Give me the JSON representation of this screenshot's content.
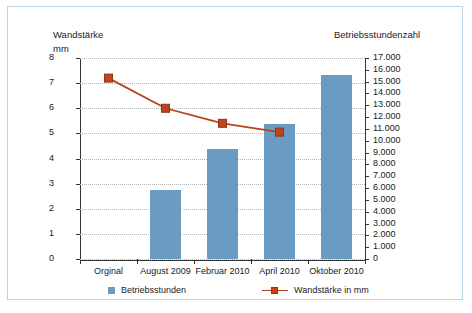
{
  "chart_data": {
    "type": "bar",
    "title": "",
    "categories": [
      "Orginal",
      "August 2009",
      "Februar 2010",
      "April 2010",
      "Oktober 2010"
    ],
    "series": [
      {
        "name": "Betriebsstunden",
        "type": "bar",
        "axis": "right",
        "color": "#6a9bc3",
        "values": [
          0,
          5800,
          9300,
          11400,
          15600
        ]
      },
      {
        "name": "Wandstärke in mm",
        "type": "line",
        "axis": "left",
        "color": "#c0451c",
        "values": [
          7.2,
          6.0,
          5.4,
          5.05,
          null
        ]
      }
    ],
    "left_axis": {
      "title": "Wandstärke",
      "unit": "mm",
      "ylim": [
        0,
        8
      ],
      "ticks": [
        "8",
        "7",
        "6",
        "5",
        "4",
        "3",
        "2",
        "1",
        "0"
      ]
    },
    "right_axis": {
      "title": "Betriebsstundenzahl",
      "ylim": [
        0,
        17000
      ],
      "ticks": [
        "17.000",
        "16.000",
        "15.000",
        "14.000",
        "13.000",
        "12.000",
        "11.000",
        "10.000",
        "9.000",
        "8.000",
        "7.000",
        "6.000",
        "5.000",
        "4.000",
        "3.000",
        "2.000",
        "1.000",
        "0"
      ]
    },
    "xlabel": "",
    "grid": true,
    "legend_position": "bottom",
    "legend": [
      {
        "label": "Betriebsstunden",
        "marker": "square",
        "color": "#6a9bc3"
      },
      {
        "label": "Wandstärke in mm",
        "marker": "line-square",
        "color": "#c0451c"
      }
    ]
  }
}
